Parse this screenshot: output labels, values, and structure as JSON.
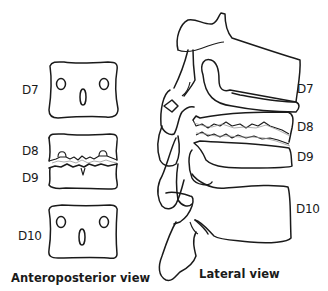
{
  "figure": {
    "type": "anatomical diagram",
    "colors": {
      "line": "#1a1a1a",
      "background": "#ffffff",
      "shading": "#9a9a9a"
    }
  },
  "anteroposterior_view": {
    "caption": "Anteroposterior view",
    "labels": {
      "d7": "D7",
      "d8": "D8",
      "d9": "D9",
      "d10": "D10"
    }
  },
  "lateral_view": {
    "caption": "Lateral view",
    "labels": {
      "d7": "D7",
      "d8": "D8",
      "d9": "D9",
      "d10": "D10"
    }
  }
}
